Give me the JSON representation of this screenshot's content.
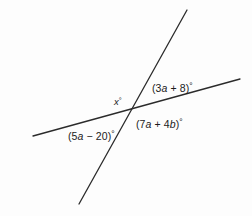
{
  "diagram": {
    "background_color": "#fdfdfd",
    "line_color": "#2b2b2b",
    "text_color": "#1b1b1b",
    "lines": [
      {
        "name": "shallow-line",
        "x1": 33,
        "y1": 136,
        "x2": 240,
        "y2": 79
      },
      {
        "name": "steep-line",
        "x1": 187,
        "y1": 10,
        "x2": 79,
        "y2": 204
      }
    ],
    "intersection": {
      "x": 133,
      "y": 110
    },
    "labels": {
      "upper_right": {
        "text": "(3a + 8)°",
        "prefix": "(3",
        "variable": "a",
        "suffix": " + 8)",
        "degree": "°",
        "x": 152,
        "y": 80
      },
      "lower_right": {
        "text": "(7a + 4b)°",
        "prefix": "(7",
        "variable1": "a",
        "middle": " + 4",
        "variable2": "b",
        "suffix": ")",
        "degree": "°",
        "x": 136,
        "y": 116
      },
      "lower_left": {
        "text": "(5a − 20)°",
        "prefix": "(5",
        "variable": "a",
        "suffix": " − 20)",
        "degree": "°",
        "x": 68,
        "y": 128
      },
      "upper_left": {
        "text": "x°",
        "variable": "x",
        "degree": "°",
        "x": 114,
        "y": 95
      }
    }
  }
}
